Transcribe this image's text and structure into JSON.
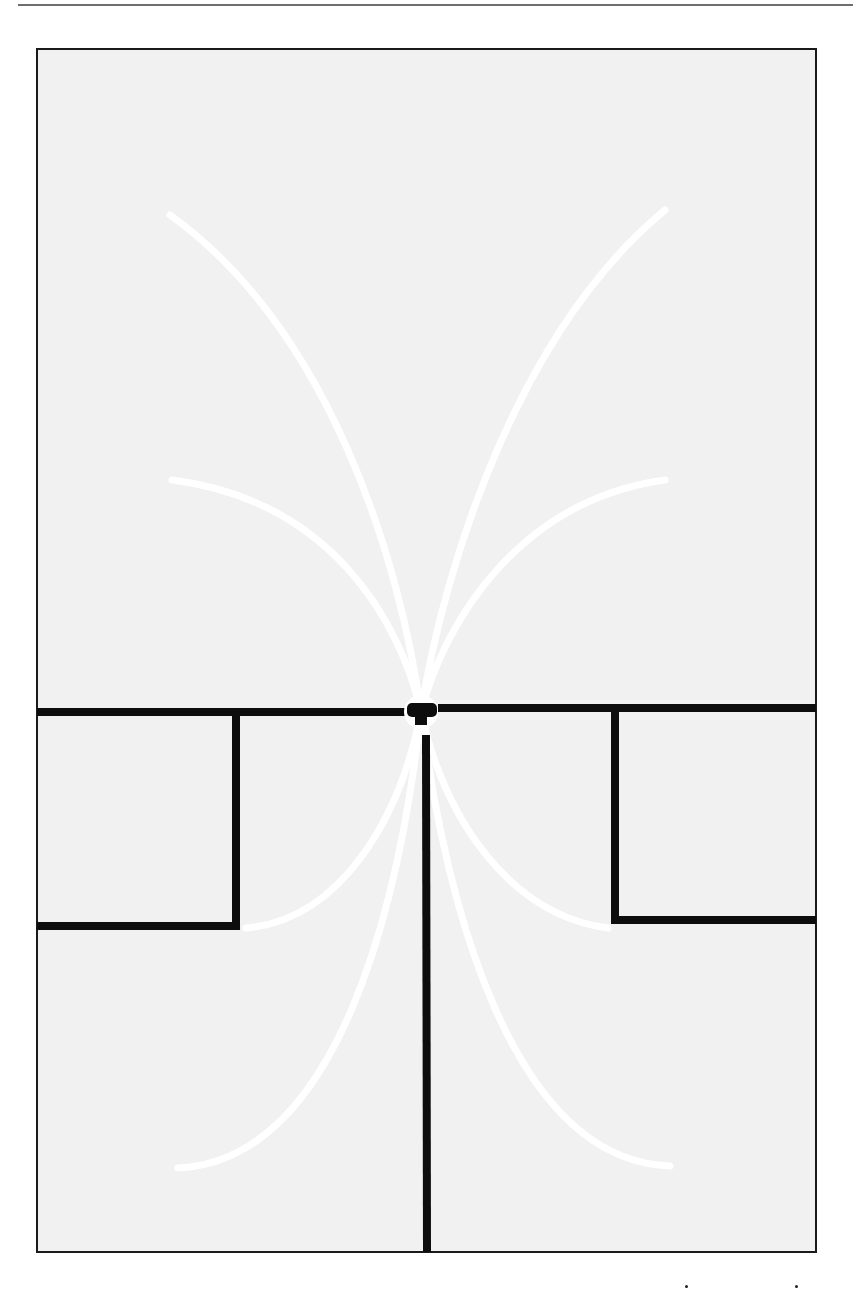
{
  "page": {
    "header_rule": true,
    "background": "#ffffff"
  },
  "figure": {
    "panel": {
      "x": 37,
      "y": 49,
      "width": 779,
      "height": 1203,
      "fill": "#f1f1f1",
      "border": "#1a1a1a"
    },
    "colors": {
      "walls": "#0d0d0d",
      "rays": "#ffffff"
    },
    "walls": [
      {
        "name": "horizontal-wall-left",
        "x1": 37,
        "y1": 712,
        "x2": 410,
        "y2": 712
      },
      {
        "name": "horizontal-wall-right",
        "x1": 438,
        "y1": 708,
        "x2": 816,
        "y2": 708
      },
      {
        "name": "left-box-vertical",
        "x1": 236,
        "y1": 712,
        "x2": 236,
        "y2": 926
      },
      {
        "name": "left-box-bottom",
        "x1": 37,
        "y1": 926,
        "x2": 240,
        "y2": 926
      },
      {
        "name": "right-box-vertical",
        "x1": 615,
        "y1": 708,
        "x2": 615,
        "y2": 920
      },
      {
        "name": "right-box-bottom",
        "x1": 611,
        "y1": 920,
        "x2": 816,
        "y2": 920
      },
      {
        "name": "center-stem",
        "x1": 426,
        "y1": 735,
        "x2": 427,
        "y2": 1252
      }
    ],
    "source": {
      "x": 421,
      "y": 712,
      "ring_radius": 17
    },
    "rays": [
      {
        "name": "ray-upper-left-outer",
        "d": "M 421 712 C 400 560, 330 330, 170 215"
      },
      {
        "name": "ray-upper-right-outer",
        "d": "M 421 712 C 445 560, 520 330, 665 210"
      },
      {
        "name": "ray-upper-left-inner",
        "d": "M 421 712 C 400 620, 330 500, 172 480"
      },
      {
        "name": "ray-upper-right-inner",
        "d": "M 421 712 C 445 620, 520 500, 665 480"
      },
      {
        "name": "ray-lower-left-inner",
        "d": "M 421 712 C 400 820, 340 920, 246 928"
      },
      {
        "name": "ray-lower-right-inner",
        "d": "M 421 712 C 445 820, 510 915, 608 928"
      },
      {
        "name": "ray-lower-left-outer",
        "d": "M 421 712 C 400 900, 340 1160, 178 1168"
      },
      {
        "name": "ray-lower-right-outer",
        "d": "M 421 712 C 445 900, 510 1160, 670 1166"
      }
    ]
  }
}
